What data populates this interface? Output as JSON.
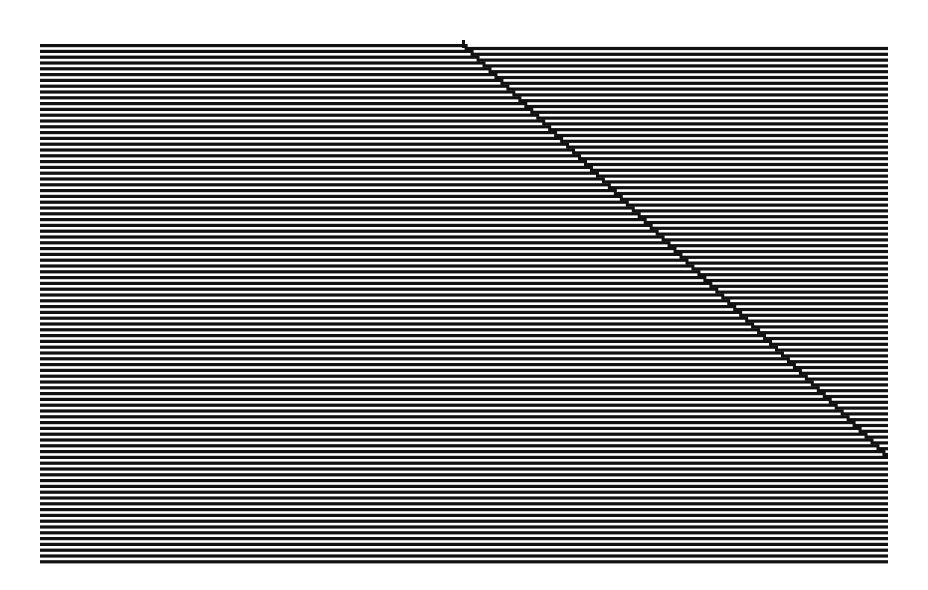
{
  "figure": {
    "type": "line-grating-illusion",
    "background": "#ffffff",
    "line_color": "#111111",
    "region": {
      "x0": 40,
      "x1": 888,
      "y0": 44,
      "y1": 566
    },
    "line_pitch": 5.8,
    "line_thickness": 3.2,
    "line_count": 90,
    "diagonal": {
      "start": {
        "x": 462,
        "y": 40
      },
      "end": {
        "x": 886,
        "y": 452
      },
      "step_width": 6,
      "shift_lines": 1
    }
  }
}
